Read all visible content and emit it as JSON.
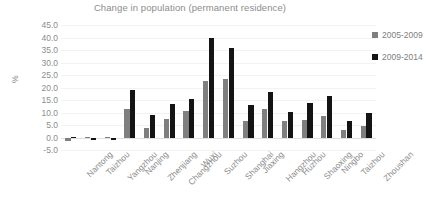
{
  "chart_data": {
    "type": "bar",
    "title": "Change in population (permanent residence)",
    "xlabel": "",
    "ylabel": "%",
    "ylim": [
      -5.0,
      45.0
    ],
    "ytick_step": 5.0,
    "yticks": [
      "45.0",
      "40.0",
      "35.0",
      "30.0",
      "25.0",
      "20.0",
      "15.0",
      "10.0",
      "5.0",
      "0.0",
      "-5.0"
    ],
    "grid": true,
    "legend_position": "right",
    "categories": [
      "Nantong",
      "Taizhou",
      "Yangzhou",
      "Nanjing",
      "Zhenjiang",
      "Changzhou",
      "Wuxi",
      "Suzhou",
      "Shanghai",
      "Jiaxing",
      "Hangzhou",
      "Huzhou",
      "Shaoxing",
      "Ningbo",
      "Taizhou",
      "Zhoushan"
    ],
    "series": [
      {
        "name": "2005-2009",
        "color": "#7f7f7f",
        "values": [
          -1.5,
          -0.3,
          -0.3,
          11.5,
          3.9,
          7.6,
          10.8,
          22.8,
          23.5,
          6.8,
          11.3,
          6.5,
          7.2,
          8.8,
          2.9,
          4.5
        ]
      },
      {
        "name": "2009-2014",
        "color": "#141414",
        "values": [
          0.2,
          -1.0,
          -1.0,
          19.2,
          8.9,
          13.5,
          15.3,
          39.7,
          35.8,
          13.2,
          18.1,
          10.1,
          14.0,
          16.8,
          6.5,
          9.9
        ]
      }
    ]
  },
  "legend": {
    "entries": [
      {
        "label": "2005-2009",
        "swatch": "legend-swatch-grey"
      },
      {
        "label": "2009-2014",
        "swatch": "legend-swatch-black"
      }
    ]
  }
}
